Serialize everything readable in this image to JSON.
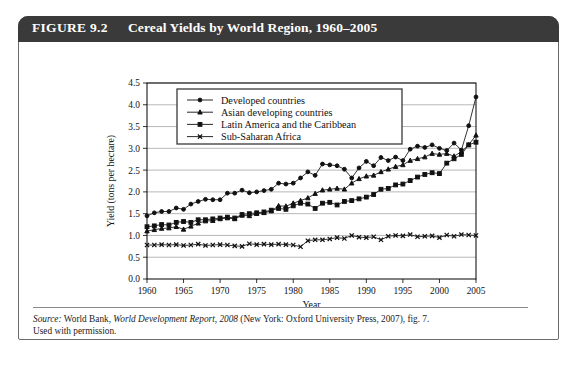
{
  "figure": {
    "number": "FIGURE 9.2",
    "title": "Cereal Yields by World Region, 1960–2005"
  },
  "source": {
    "label": "Source:",
    "text_1": " World Bank, ",
    "italic_1": "World Development Report, 2008",
    "text_2": " (New York: Oxford University Press, 2007), fig. 7.",
    "text_3": "Used with permission."
  },
  "chart_data": {
    "type": "line",
    "title": "Cereal Yields by World Region, 1960–2005",
    "xlabel": "Year",
    "ylabel": "Yield (tons per hectare)",
    "xlim": [
      1960,
      2005
    ],
    "ylim": [
      0.0,
      4.5
    ],
    "xticks": [
      1960,
      1965,
      1970,
      1975,
      1980,
      1985,
      1990,
      1995,
      2000,
      2005
    ],
    "yticks": [
      0.0,
      0.5,
      1.0,
      1.5,
      2.0,
      2.5,
      3.0,
      3.5,
      4.0,
      4.5
    ],
    "grid": "horizontal",
    "legend_position": "top-left-inside",
    "x": [
      1960,
      1961,
      1962,
      1963,
      1964,
      1965,
      1966,
      1967,
      1968,
      1969,
      1970,
      1971,
      1972,
      1973,
      1974,
      1975,
      1976,
      1977,
      1978,
      1979,
      1980,
      1981,
      1982,
      1983,
      1984,
      1985,
      1986,
      1987,
      1988,
      1989,
      1990,
      1991,
      1992,
      1993,
      1994,
      1995,
      1996,
      1997,
      1998,
      1999,
      2000,
      2001,
      2002,
      2003,
      2004,
      2005
    ],
    "series": [
      {
        "name": "Developed countries",
        "marker": "circle",
        "values": [
          1.45,
          1.52,
          1.55,
          1.55,
          1.63,
          1.6,
          1.72,
          1.78,
          1.83,
          1.82,
          1.82,
          1.97,
          1.97,
          2.04,
          1.98,
          2.0,
          2.03,
          2.06,
          2.2,
          2.18,
          2.2,
          2.32,
          2.46,
          2.38,
          2.64,
          2.62,
          2.6,
          2.52,
          2.32,
          2.55,
          2.7,
          2.6,
          2.79,
          2.72,
          2.8,
          2.72,
          2.98,
          3.05,
          3.02,
          3.08,
          3.0,
          2.95,
          3.12,
          2.96,
          3.52,
          4.18
        ]
      },
      {
        "name": "Asian developing countries",
        "marker": "triangle",
        "values": [
          1.1,
          1.13,
          1.16,
          1.17,
          1.2,
          1.14,
          1.21,
          1.28,
          1.33,
          1.34,
          1.38,
          1.4,
          1.38,
          1.46,
          1.45,
          1.5,
          1.52,
          1.56,
          1.68,
          1.67,
          1.74,
          1.8,
          1.86,
          1.96,
          2.04,
          2.06,
          2.08,
          2.06,
          2.2,
          2.3,
          2.36,
          2.38,
          2.46,
          2.52,
          2.58,
          2.62,
          2.72,
          2.76,
          2.8,
          2.88,
          2.86,
          2.88,
          2.82,
          2.92,
          3.08,
          3.3
        ]
      },
      {
        "name": "Latin America and the Caribbean",
        "marker": "square",
        "values": [
          1.2,
          1.22,
          1.25,
          1.24,
          1.3,
          1.32,
          1.3,
          1.36,
          1.36,
          1.38,
          1.4,
          1.42,
          1.4,
          1.48,
          1.5,
          1.52,
          1.54,
          1.58,
          1.62,
          1.6,
          1.68,
          1.74,
          1.72,
          1.62,
          1.74,
          1.76,
          1.7,
          1.78,
          1.8,
          1.84,
          1.88,
          1.94,
          2.06,
          2.08,
          2.16,
          2.18,
          2.26,
          2.34,
          2.4,
          2.44,
          2.42,
          2.66,
          2.76,
          2.86,
          3.08,
          3.14
        ]
      },
      {
        "name": "Sub-Saharan Africa",
        "marker": "cross",
        "values": [
          0.78,
          0.78,
          0.79,
          0.78,
          0.79,
          0.77,
          0.78,
          0.8,
          0.77,
          0.78,
          0.79,
          0.78,
          0.76,
          0.75,
          0.81,
          0.79,
          0.8,
          0.79,
          0.8,
          0.79,
          0.78,
          0.74,
          0.88,
          0.9,
          0.9,
          0.92,
          0.95,
          0.93,
          1.0,
          0.96,
          0.95,
          0.97,
          0.9,
          0.98,
          1.0,
          0.99,
          1.02,
          0.97,
          0.98,
          0.99,
          0.95,
          1.01,
          0.98,
          1.02,
          1.01,
          1.0
        ]
      }
    ]
  }
}
